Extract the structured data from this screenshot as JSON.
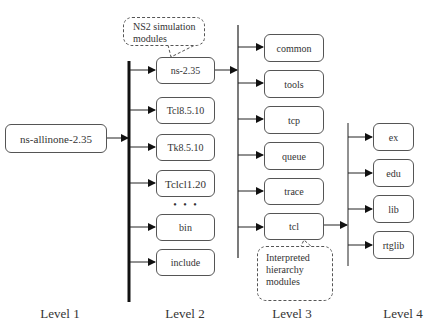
{
  "diagram": {
    "type": "directory-hierarchy",
    "level1": {
      "label": "ns-allinone-2.35"
    },
    "level2": {
      "items": [
        {
          "label": "ns-2.35"
        },
        {
          "label": "Tcl8.5.10"
        },
        {
          "label": "Tk8.5.10"
        },
        {
          "label": "Tclcl1.20"
        },
        {
          "label": "bin"
        },
        {
          "label": "include"
        }
      ],
      "ellipsis": "• • •"
    },
    "level3": {
      "parent": "ns-2.35",
      "items": [
        {
          "label": "common"
        },
        {
          "label": "tools"
        },
        {
          "label": "tcp"
        },
        {
          "label": "queue"
        },
        {
          "label": "trace"
        },
        {
          "label": "tcl"
        }
      ]
    },
    "level4": {
      "parent": "tcl",
      "items": [
        {
          "label": "ex"
        },
        {
          "label": "edu"
        },
        {
          "label": "lib"
        },
        {
          "label": "rtglib"
        }
      ]
    },
    "callouts": {
      "ns2": "NS2 simulation modules",
      "tcl": "Interpreted hierarchy modules"
    },
    "level_labels": [
      "Level 1",
      "Level 2",
      "Level 3",
      "Level 4"
    ]
  }
}
